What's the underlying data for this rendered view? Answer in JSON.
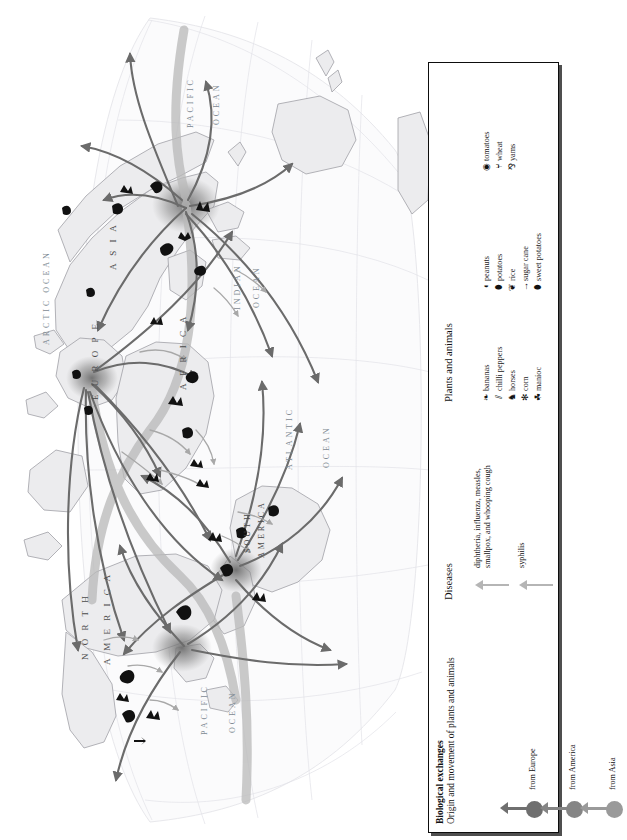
{
  "map": {
    "ocean_labels": [
      {
        "text": "ARCTIC OCEAN",
        "x": 42,
        "y": 345,
        "rot": -90,
        "size": 8
      },
      {
        "text": "PACIFIC",
        "x": 186,
        "y": 128,
        "rot": -90,
        "size": 8
      },
      {
        "text": "OCEAN",
        "x": 212,
        "y": 125,
        "rot": -90,
        "size": 8
      },
      {
        "text": "INDIAN",
        "x": 233,
        "y": 310,
        "rot": -90,
        "size": 8
      },
      {
        "text": "OCEAN",
        "x": 252,
        "y": 308,
        "rot": -90,
        "size": 8
      },
      {
        "text": "ATLANTIC",
        "x": 285,
        "y": 470,
        "rot": -90,
        "size": 8
      },
      {
        "text": "OCEAN",
        "x": 322,
        "y": 468,
        "rot": -90,
        "size": 8
      },
      {
        "text": "PACIFIC",
        "x": 200,
        "y": 735,
        "rot": -90,
        "size": 8
      },
      {
        "text": "OCEAN",
        "x": 228,
        "y": 733,
        "rot": -90,
        "size": 8
      }
    ],
    "continent_labels": [
      {
        "text": "A S I A",
        "x": 108,
        "y": 270,
        "rot": -90,
        "size": 9
      },
      {
        "text": "E U R O P E",
        "x": 90,
        "y": 400,
        "rot": -90,
        "size": 9
      },
      {
        "text": "A F R I C A",
        "x": 178,
        "y": 390,
        "rot": -90,
        "size": 9
      },
      {
        "text": "SOUTH",
        "x": 243,
        "y": 553,
        "rot": -90,
        "size": 8
      },
      {
        "text": "AMERICA",
        "x": 257,
        "y": 558,
        "rot": -90,
        "size": 8
      },
      {
        "text": "N O R T H",
        "x": 80,
        "y": 660,
        "rot": -90,
        "size": 9
      },
      {
        "text": "A M E R I C A",
        "x": 102,
        "y": 665,
        "rot": -90,
        "size": 9
      }
    ]
  },
  "legend": {
    "title": "Biological exchanges",
    "subtitle": "Origin and movement of plants and animals",
    "origins": [
      {
        "label": "from Europe",
        "color": "#6f6f6f"
      },
      {
        "label": "from America",
        "color": "#858585"
      },
      {
        "label": "from Asia",
        "color": "#9a9a9a"
      }
    ],
    "diseases_heading": "Diseases",
    "diseases": [
      {
        "label_line1": "diphtheria, influenza, measles,",
        "label_line2": "smallpox, and whooping cough"
      },
      {
        "label_line1": "syphilis",
        "label_line2": ""
      }
    ],
    "plants_heading": "Plants and animals",
    "plants_columns": [
      [
        {
          "icon": "banana-icon",
          "glyph": "❧",
          "label": "bananas"
        },
        {
          "icon": "chilli-pepper-icon",
          "glyph": "⫽",
          "label": "chilli peppers"
        },
        {
          "icon": "horse-icon",
          "glyph": "♞",
          "label": "horses"
        },
        {
          "icon": "corn-icon",
          "glyph": "✻",
          "label": "corn"
        },
        {
          "icon": "manioc-icon",
          "glyph": "☘",
          "label": "manioc"
        }
      ],
      [
        {
          "icon": "peanut-icon",
          "glyph": "◖",
          "label": "peanuts"
        },
        {
          "icon": "potato-icon",
          "glyph": "⬮",
          "label": "potatoes"
        },
        {
          "icon": "rice-icon",
          "glyph": "❦",
          "label": "rice"
        },
        {
          "icon": "sugar-cane-icon",
          "glyph": "→",
          "label": "sugar cane"
        },
        {
          "icon": "sweet-potato-icon",
          "glyph": "⬮",
          "label": "sweet potatoes"
        }
      ],
      [
        {
          "icon": "tomato-icon",
          "glyph": "◉",
          "label": "tomatoes"
        },
        {
          "icon": "wheat-icon",
          "glyph": "⑂",
          "label": "wheat"
        },
        {
          "icon": "yam-icon",
          "glyph": "⅋",
          "label": "yams"
        }
      ]
    ]
  },
  "colors": {
    "arrow_dark": "#6b6b6b",
    "arrow_mid": "#8b8b8b",
    "arrow_light": "#b5b5b5",
    "land": "#ececed",
    "coast": "#9a9aa0",
    "graticule": "#dedee2",
    "legend_border": "#0d0d0d"
  }
}
